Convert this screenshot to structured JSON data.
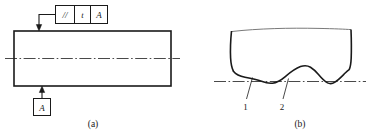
{
  "figure": {
    "background_color": "#ffffff",
    "line_color": "#1a1a1a",
    "thin_line_color": "#555555"
  },
  "panel_a": {
    "caption": "(a)",
    "feature_control_frame": {
      "name": "parallelism-feature-control-frame",
      "cells": [
        {
          "key": "symbol",
          "text": "//",
          "meaning": "parallelism-symbol"
        },
        {
          "key": "tolerance",
          "text": "t",
          "meaning": "tolerance-value"
        },
        {
          "key": "datum",
          "text": "A",
          "meaning": "datum-reference"
        }
      ]
    },
    "datum_feature_symbol": {
      "name": "datum-feature-symbol-a",
      "label": "A"
    },
    "part": {
      "name": "rectangular-part-outline"
    },
    "centerline": {
      "name": "part-centerline",
      "style": "dash-dot"
    }
  },
  "panel_b": {
    "caption": "(b)",
    "surface": {
      "name": "irregular-surface-profile",
      "top_edge": "break-line"
    },
    "datum_line": {
      "name": "datum-reference-line",
      "style": "dash-dot"
    },
    "callouts": [
      {
        "key": "callout-1",
        "label": "1"
      },
      {
        "key": "callout-2",
        "label": "2"
      }
    ]
  }
}
